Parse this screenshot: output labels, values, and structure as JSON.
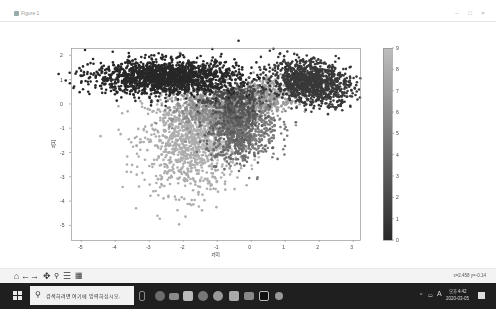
{
  "window": {
    "title": "Figure 1",
    "controls": [
      "minimize",
      "maximize",
      "close"
    ]
  },
  "toolbar": {
    "buttons": [
      {
        "name": "home",
        "glyph": "⌂"
      },
      {
        "name": "back",
        "glyph": "←"
      },
      {
        "name": "forward",
        "glyph": "→"
      },
      {
        "name": "pan",
        "glyph": "✥"
      },
      {
        "name": "zoom",
        "glyph": "🔍"
      },
      {
        "name": "configure-subplots",
        "glyph": "☰"
      },
      {
        "name": "save",
        "glyph": "🖫"
      }
    ],
    "coordinates": "x=2.458 y=-0.14"
  },
  "taskbar": {
    "search_placeholder": "검색하려면 여기에 입력하십시오.",
    "apps": [
      "task-view",
      "edge",
      "mail",
      "store",
      "chrome",
      "ie",
      "photos",
      "explorer",
      "terminal",
      "python"
    ],
    "clock_time": "오후 4:42",
    "clock_date": "2020-03-05",
    "ime": "A"
  },
  "chart_data": {
    "type": "scatter",
    "title": "",
    "xlabel": "z[0]",
    "ylabel": "z[1]",
    "xlim": [
      -5.3,
      3.2
    ],
    "ylim": [
      -5.6,
      2.3
    ],
    "xticks": [
      "-5",
      "-4",
      "-3",
      "-2",
      "-1",
      "0",
      "1",
      "2",
      "3"
    ],
    "yticks": [
      "2",
      "1",
      "0",
      "-1",
      "-2",
      "-3",
      "-4",
      "-5"
    ],
    "grid": false,
    "colormap": "gray",
    "colorbar": {
      "min": 0,
      "max": 9,
      "ticks": [
        "0",
        "1",
        "2",
        "3",
        "4",
        "5",
        "6",
        "7",
        "8",
        "9"
      ]
    },
    "clusters": [
      {
        "label": 0,
        "cx": -2.5,
        "cy": 1.1,
        "sx": 1.05,
        "sy": 0.35,
        "n": 1100,
        "tilt": 0.08
      },
      {
        "label": 1,
        "cx": 1.75,
        "cy": 0.9,
        "sx": 0.55,
        "sy": 0.45,
        "n": 700,
        "tilt": -0.3
      },
      {
        "label": 8,
        "cx": -1.8,
        "cy": -1.5,
        "sx": 0.7,
        "sy": 1.1,
        "n": 1100,
        "tilt": 0.0
      },
      {
        "label": 7,
        "cx": 0.3,
        "cy": 0.2,
        "sx": 0.55,
        "sy": 0.5,
        "n": 500,
        "tilt": 0.5
      },
      {
        "label": 5,
        "cx": -0.1,
        "cy": -0.9,
        "sx": 0.45,
        "sy": 0.7,
        "n": 450,
        "tilt": 0.0
      },
      {
        "label": 3,
        "cx": -0.4,
        "cy": -0.3,
        "sx": 0.4,
        "sy": 0.5,
        "n": 300,
        "tilt": 0.0
      },
      {
        "label": 6,
        "cx": -1.4,
        "cy": -0.2,
        "sx": 0.5,
        "sy": 0.45,
        "n": 350,
        "tilt": 0.0
      },
      {
        "label": 4,
        "cx": -0.5,
        "cy": -1.4,
        "sx": 0.4,
        "sy": 0.5,
        "n": 300,
        "tilt": 0.0
      },
      {
        "label": 9,
        "cx": -1.0,
        "cy": -1.0,
        "sx": 0.45,
        "sy": 0.6,
        "n": 350,
        "tilt": 0.0
      },
      {
        "label": 2,
        "cx": -0.6,
        "cy": 0.3,
        "sx": 0.5,
        "sy": 0.35,
        "n": 200,
        "tilt": 0.0
      }
    ]
  }
}
